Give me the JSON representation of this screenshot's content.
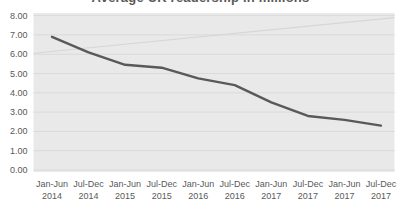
{
  "chart_data": {
    "type": "line",
    "title": "Average UK readership in millions",
    "categories": [
      [
        "Jan-Jun",
        "2014"
      ],
      [
        "Jul-Dec",
        "2014"
      ],
      [
        "Jan-Jun",
        "2015"
      ],
      [
        "Jul-Dec",
        "2015"
      ],
      [
        "Jan-Jun",
        "2016"
      ],
      [
        "Jul-Dec",
        "2016"
      ],
      [
        "Jan-Jun",
        "2017"
      ],
      [
        "Jul-Dec",
        "2017"
      ],
      [
        "Jan-Jun",
        "2017"
      ],
      [
        "Jul-Dec",
        "2017"
      ]
    ],
    "series": [
      {
        "name": "Average UK readership",
        "values": [
          6.9,
          6.1,
          5.45,
          5.3,
          4.75,
          4.4,
          3.5,
          2.8,
          2.6,
          2.3
        ],
        "color": "#595959"
      }
    ],
    "trendline": {
      "start": 6.05,
      "end": 7.9,
      "color": "#d6d6d6"
    },
    "ylim": [
      0,
      8
    ],
    "ytick_step": 1,
    "ytick_labels": [
      "0.00",
      "1.00",
      "2.00",
      "3.00",
      "4.00",
      "5.00",
      "6.00",
      "7.00",
      "8.00"
    ],
    "grid": true,
    "legend": "none",
    "colors": {
      "plot_bg": "#e9e9e9",
      "grid": "#dadada",
      "labels": "#595959",
      "title": "#595959"
    }
  }
}
